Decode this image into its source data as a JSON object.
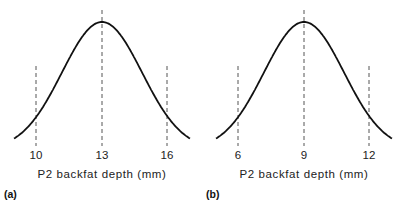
{
  "chart_data": [
    {
      "type": "line",
      "panel_label": "(a)",
      "title": "",
      "xlabel": "P2 backfat depth (mm)",
      "ylabel": "",
      "tick_labels": [
        "10",
        "13",
        "16"
      ],
      "mean": 13,
      "sd_markers": [
        10,
        16
      ],
      "distribution": "normal",
      "xlim": [
        8.7,
        17.3
      ],
      "grid": false,
      "dashed_lines_at": [
        10,
        13,
        16
      ]
    },
    {
      "type": "line",
      "panel_label": "(b)",
      "title": "",
      "xlabel": "P2 backfat depth (mm)",
      "ylabel": "",
      "tick_labels": [
        "6",
        "9",
        "12"
      ],
      "mean": 9,
      "sd_markers": [
        6,
        12
      ],
      "distribution": "normal",
      "xlim": [
        4.7,
        13.3
      ],
      "grid": false,
      "dashed_lines_at": [
        6,
        9,
        12
      ]
    }
  ]
}
